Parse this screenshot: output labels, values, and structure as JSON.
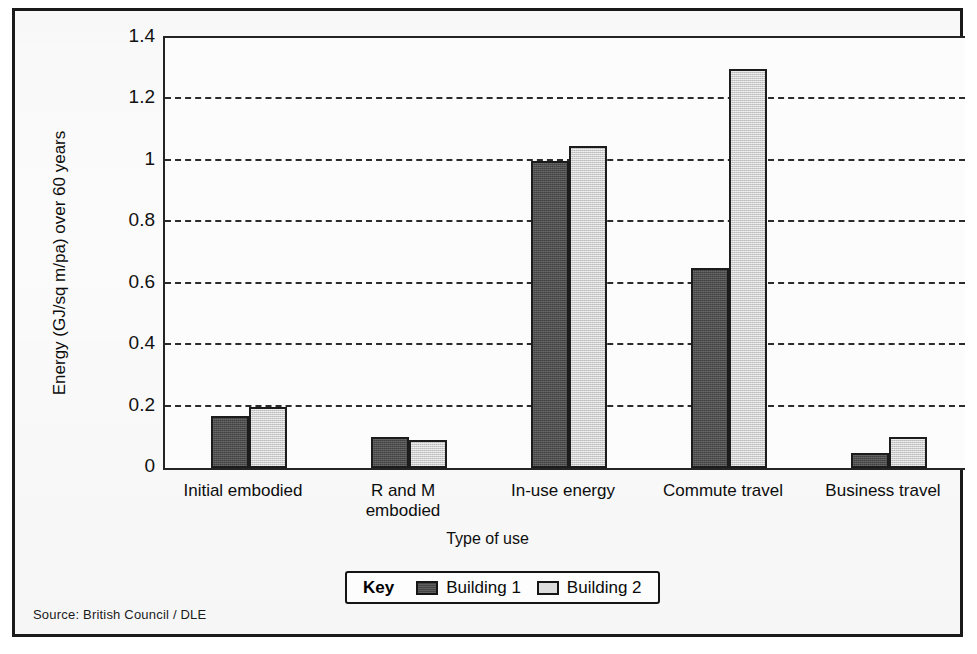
{
  "figure": {
    "source_note": "Source: British Council / DLE"
  },
  "legend": {
    "title": "Key",
    "entries": [
      {
        "label": "Building 1",
        "color": "#4d4d4d"
      },
      {
        "label": "Building 2",
        "color": "#d2d2d2"
      }
    ]
  },
  "chart_data": {
    "type": "bar",
    "title": "",
    "xlabel": "Type of use",
    "ylabel": "Energy (GJ/sq m/pa) over 60 years",
    "categories": [
      "Initial embodied",
      "R and M\nembodied",
      "In-use energy",
      "Commute travel",
      "Business travel"
    ],
    "series": [
      {
        "name": "Building 1",
        "color": "#4d4d4d",
        "values": [
          0.17,
          0.1,
          1.0,
          0.65,
          0.05
        ]
      },
      {
        "name": "Building 2",
        "color": "#d2d2d2",
        "values": [
          0.2,
          0.09,
          1.05,
          1.3,
          0.1
        ]
      }
    ],
    "ylim": [
      0,
      1.4
    ],
    "yticks": [
      0,
      0.2,
      0.4,
      0.6,
      0.8,
      1,
      1.2,
      1.4
    ],
    "ytick_labels": [
      "0",
      "0.2",
      "0.4",
      "0.6",
      "0.8",
      "1",
      "1.2",
      "1.4"
    ],
    "grid": true,
    "grid_style": "dashed-horizontal",
    "legend_position": "bottom-center"
  }
}
